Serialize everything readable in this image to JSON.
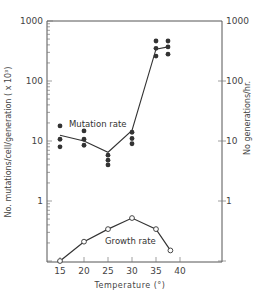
{
  "chart_data": {
    "type": "line",
    "title": "",
    "xlabel": "Temperature (°)",
    "ylabel_left": "No. mutations/cell/generation (x 10^3)",
    "ylabel_right": "No. generations/hr.",
    "yscale": "log",
    "ylim": [
      0.1,
      1000
    ],
    "xlim": [
      12,
      45
    ],
    "x_ticks": [
      15,
      20,
      25,
      30,
      35,
      40
    ],
    "y_ticks_left": [
      1000,
      100,
      10,
      1
    ],
    "y_ticks_right": [
      1000,
      100,
      10,
      1
    ],
    "grid": false,
    "series": [
      {
        "name": "Mutation rate",
        "marker": "filled-circle",
        "points": [
          {
            "x": 15,
            "y": [
              17.8,
              10.7,
              8.0
            ]
          },
          {
            "x": 20,
            "y": [
              14.7,
              10.7,
              8.5
            ]
          },
          {
            "x": 25,
            "y": [
              5.8,
              4.8,
              4.0
            ]
          },
          {
            "x": 30,
            "y": [
              14.0,
              11.0,
              9.0
            ]
          },
          {
            "x": 35,
            "y": [
              464,
              350,
              260
            ]
          },
          {
            "x": 37.5,
            "y": [
              464,
              370,
              280
            ]
          }
        ],
        "line": [
          {
            "x": 15,
            "y": 12.5
          },
          {
            "x": 20,
            "y": 10.0
          },
          {
            "x": 25,
            "y": 6.5
          },
          {
            "x": 30,
            "y": 15.0
          },
          {
            "x": 35,
            "y": 340
          },
          {
            "x": 37.5,
            "y": 370
          }
        ]
      },
      {
        "name": "Growth rate",
        "marker": "open-circle",
        "x": [
          15,
          20,
          25,
          30,
          35,
          38
        ],
        "values": [
          0.1,
          0.21,
          0.34,
          0.52,
          0.34,
          0.15
        ]
      }
    ],
    "annotations": [
      "Mutation rate",
      "Growth rate"
    ]
  },
  "labels": {
    "x_axis_title": "Temperature  (°)",
    "left_axis_title": "No.  mutations/cell/generation  ( x 10³)",
    "right_axis_title": "No  generations/hr.",
    "mutation_label": "Mutation rate",
    "growth_label": "Growth rate",
    "x_ticks": [
      "15",
      "20",
      "25",
      "30",
      "35",
      "40"
    ],
    "y_left": [
      "1000",
      "100",
      "10",
      "1"
    ],
    "y_right": [
      "1000",
      "100",
      "10",
      "1"
    ]
  }
}
